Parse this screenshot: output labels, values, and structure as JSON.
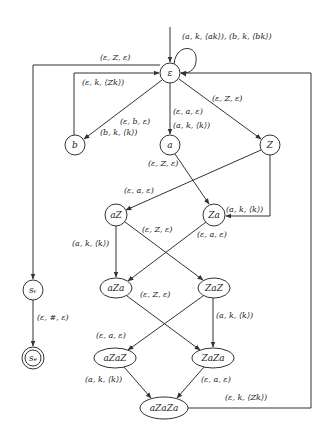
{
  "diagram": {
    "type": "automaton",
    "nodes": [
      {
        "id": "eps",
        "label": "ε",
        "shape": "circle",
        "x": 170,
        "y": 73,
        "rx": 10,
        "ry": 10,
        "initial": true
      },
      {
        "id": "b",
        "label": "b",
        "shape": "circle",
        "x": 75,
        "y": 145,
        "rx": 10,
        "ry": 10
      },
      {
        "id": "a",
        "label": "a",
        "shape": "circle",
        "x": 170,
        "y": 145,
        "rx": 10,
        "ry": 10
      },
      {
        "id": "Z",
        "label": "Z",
        "shape": "circle",
        "x": 270,
        "y": 145,
        "rx": 10,
        "ry": 10
      },
      {
        "id": "aZ",
        "label": "aZ",
        "shape": "circle",
        "x": 116,
        "y": 215,
        "rx": 11,
        "ry": 11
      },
      {
        "id": "Za",
        "label": "Za",
        "shape": "circle",
        "x": 214,
        "y": 215,
        "rx": 11,
        "ry": 11
      },
      {
        "id": "aZa",
        "label": "aZa",
        "shape": "ellipse",
        "x": 116,
        "y": 288,
        "rx": 16,
        "ry": 10
      },
      {
        "id": "ZaZ",
        "label": "ZaZ",
        "shape": "ellipse",
        "x": 214,
        "y": 288,
        "rx": 16,
        "ry": 10
      },
      {
        "id": "sv",
        "label": "sᵥ",
        "shape": "circle",
        "x": 33,
        "y": 290,
        "rx": 10,
        "ry": 10
      },
      {
        "id": "se",
        "label": "sₑ",
        "shape": "doublecircle",
        "x": 33,
        "y": 358,
        "rx": 10,
        "ry": 10
      },
      {
        "id": "aZaZ",
        "label": "aZaZ",
        "shape": "ellipse",
        "x": 115,
        "y": 358,
        "rx": 21,
        "ry": 10
      },
      {
        "id": "ZaZa",
        "label": "ZaZa",
        "shape": "ellipse",
        "x": 213,
        "y": 358,
        "rx": 21,
        "ry": 10
      },
      {
        "id": "aZaZa",
        "label": "aZaZa",
        "shape": "ellipse",
        "x": 164,
        "y": 408,
        "rx": 24,
        "ry": 11
      }
    ],
    "edges": [
      {
        "from": "eps",
        "to": "eps",
        "label": "(a, k, ⟨ak⟩), (b, k, ⟨bk⟩)",
        "lx": 182,
        "ly": 39
      },
      {
        "from": "eps",
        "to": "sv",
        "label": "(ε, Z, ε)",
        "lx": 100,
        "ly": 60
      },
      {
        "from": "b",
        "to": "eps",
        "label": "(ε, k, ⟨Zk⟩)",
        "lx": 82,
        "ly": 85
      },
      {
        "from": "eps",
        "to": "b",
        "label": "(ε, b, ε)",
        "lx": 120,
        "ly": 124
      },
      {
        "from": "eps",
        "to": "b",
        "label": "(b, k, ⟨k⟩)",
        "lx": 100,
        "ly": 135
      },
      {
        "from": "eps",
        "to": "a",
        "label": "(ε, a, ε)",
        "lx": 173,
        "ly": 114
      },
      {
        "from": "eps",
        "to": "a",
        "label": "(a, k, ⟨k⟩)",
        "lx": 173,
        "ly": 128
      },
      {
        "from": "eps",
        "to": "Z",
        "label": "(ε, Z, ε)",
        "lx": 212,
        "ly": 101
      },
      {
        "from": "a",
        "to": "Za",
        "label": "(ε, Z, ε)",
        "lx": 148,
        "ly": 166
      },
      {
        "from": "Z",
        "to": "aZ",
        "label": "(ε, a, ε)",
        "lx": 124,
        "ly": 193
      },
      {
        "from": "Z",
        "to": "Za",
        "label": "(a, k, ⟨k⟩)",
        "lx": 226,
        "ly": 212
      },
      {
        "from": "aZ",
        "to": "ZaZ",
        "label": "(ε, Z, ε)",
        "lx": 142,
        "ly": 232
      },
      {
        "from": "Za",
        "to": "aZa",
        "label": "(ε, a, ε)",
        "lx": 197,
        "ly": 237
      },
      {
        "from": "aZ",
        "to": "aZa",
        "label": "(a, k, ⟨k⟩)",
        "lx": 72,
        "ly": 246
      },
      {
        "from": "aZa",
        "to": "ZaZa",
        "label": "(ε, Z, ε)",
        "lx": 140,
        "ly": 297
      },
      {
        "from": "ZaZ",
        "to": "aZaZ",
        "label": "(ε, a, ε)",
        "lx": 96,
        "ly": 338
      },
      {
        "from": "ZaZ",
        "to": "ZaZa",
        "label": "(a, k, ⟨k⟩)",
        "lx": 216,
        "ly": 318
      },
      {
        "from": "sv",
        "to": "se",
        "label": "(ε, #, ε)",
        "lx": 37,
        "ly": 320
      },
      {
        "from": "aZaZ",
        "to": "aZaZa",
        "label": "(a, k, ⟨k⟩)",
        "lx": 85,
        "ly": 382
      },
      {
        "from": "ZaZa",
        "to": "aZaZa",
        "label": "(ε, a, ε)",
        "lx": 201,
        "ly": 382
      },
      {
        "from": "aZaZa",
        "to": "eps",
        "label": "(ε, k, ⟨Zk⟩)",
        "lx": 225,
        "ly": 400
      }
    ]
  }
}
